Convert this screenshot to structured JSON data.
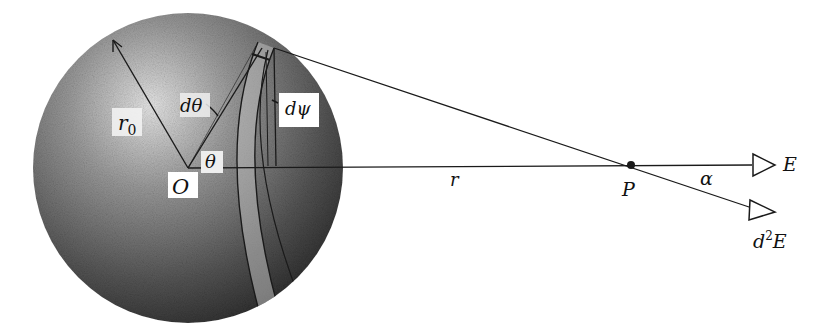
{
  "diagram": {
    "labels": {
      "radius": "r",
      "radius_sub": "0",
      "center": "O",
      "polar_angle": "θ",
      "d_theta": "dθ",
      "d_psi": "dψ",
      "distance": "r",
      "point": "P",
      "angle_alpha": "α",
      "field": "E",
      "d2_field_d": "d",
      "d2_field_sup": "2",
      "d2_field_E": "E"
    },
    "colors": {
      "line": "#1a1a1a",
      "sphere_light": "#d8d8d8",
      "sphere_dark": "#3a3a3a",
      "background": "#ffffff"
    }
  }
}
